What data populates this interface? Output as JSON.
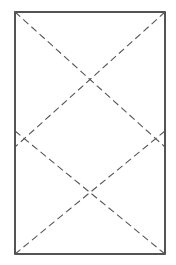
{
  "diagram": {
    "background": "#ffffff",
    "frame": {
      "x": 15,
      "y": 12,
      "width": 150,
      "height": 242,
      "stroke": "#2a2a2a",
      "stroke_width": 1.6
    },
    "dashed_lines": {
      "stroke": "#555555",
      "stroke_width": 1.1,
      "dash": "7,4",
      "lines": [
        {
          "name": "upper-diagonal-tl",
          "x1": 15,
          "y1": 12,
          "x2": 165,
          "y2": 147
        },
        {
          "name": "upper-diagonal-tr",
          "x1": 165,
          "y1": 12,
          "x2": 15,
          "y2": 147
        },
        {
          "name": "lower-diagonal-l",
          "x1": 15,
          "y1": 131,
          "x2": 165,
          "y2": 254
        },
        {
          "name": "lower-diagonal-r",
          "x1": 165,
          "y1": 131,
          "x2": 15,
          "y2": 254
        }
      ]
    }
  }
}
